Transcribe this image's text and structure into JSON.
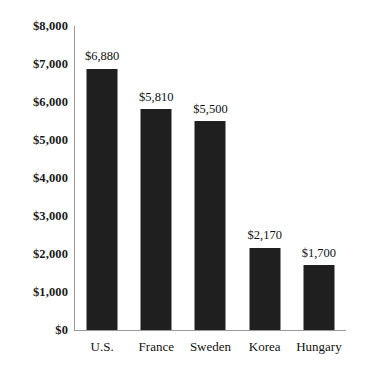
{
  "chart_data": {
    "type": "bar",
    "title": "",
    "xlabel": "",
    "ylabel": "",
    "categories": [
      "U.S.",
      "France",
      "Sweden",
      "Korea",
      "Hungary"
    ],
    "values": [
      6880,
      5810,
      5500,
      2170,
      1700
    ],
    "value_labels": [
      "$6,880",
      "$5,810",
      "$5,500",
      "$2,170",
      "$1,700"
    ],
    "ylim": [
      0,
      8000
    ],
    "ytick_values": [
      8000,
      7000,
      6000,
      5000,
      4000,
      3000,
      2000,
      1000,
      0
    ],
    "ytick_labels": [
      "$8,000",
      "$7,000",
      "$6,000",
      "$5,000",
      "$4,000",
      "$3,000",
      "$2,000",
      "$1,000",
      "$0"
    ],
    "ytick_step": 1000,
    "grid": false,
    "legend": false,
    "legend_position": "none",
    "bar_color": "#1f1f1f",
    "axis_color": "#9a9a9a",
    "background_color": "#ffffff"
  }
}
